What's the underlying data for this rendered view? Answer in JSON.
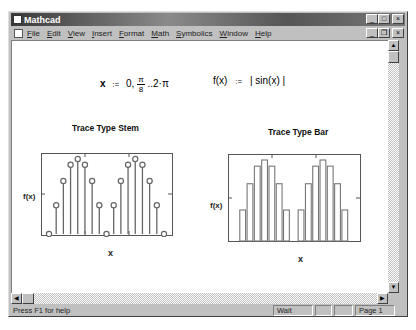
{
  "window": {
    "title": "Mathcad"
  },
  "menubar": {
    "items": [
      "File",
      "Edit",
      "View",
      "Insert",
      "Format",
      "Math",
      "Symbolics",
      "Window",
      "Help"
    ]
  },
  "caption_buttons": {
    "minimize": "_",
    "maximize": "□",
    "close": "×",
    "restore": "❐"
  },
  "worksheet": {
    "range_def": {
      "lhs": "x",
      "assign": ":=",
      "start": "0,",
      "step_num": "π",
      "step_den": "8",
      "end": "..2·π"
    },
    "func_def": {
      "lhs": "f(x)",
      "assign": ":=",
      "rhs": "| sin(x) |"
    },
    "plots": [
      {
        "title": "Trace Type Stem",
        "ylabel": "f(x)",
        "xlabel": "x",
        "trace_type": "stem"
      },
      {
        "title": "Trace Type Bar",
        "ylabel": "f(x)",
        "xlabel": "x",
        "trace_type": "bar"
      }
    ]
  },
  "statusbar": {
    "help": "Press F1 for help",
    "state": "Wait",
    "cell2": "",
    "cell3": "",
    "page": "Page 1"
  },
  "chart_data": [
    {
      "type": "stem",
      "title": "Trace Type Stem",
      "xlabel": "x",
      "ylabel": "f(x)",
      "x": [
        0,
        0.393,
        0.785,
        1.178,
        1.571,
        1.963,
        2.356,
        2.749,
        3.142,
        3.534,
        3.927,
        4.32,
        4.712,
        5.105,
        5.498,
        5.89,
        6.283
      ],
      "values": [
        0,
        0.383,
        0.707,
        0.924,
        1.0,
        0.924,
        0.707,
        0.383,
        0,
        0.383,
        0.707,
        0.924,
        1.0,
        0.924,
        0.707,
        0.383,
        0
      ]
    },
    {
      "type": "bar",
      "title": "Trace Type Bar",
      "xlabel": "x",
      "ylabel": "f(x)",
      "x": [
        0,
        0.393,
        0.785,
        1.178,
        1.571,
        1.963,
        2.356,
        2.749,
        3.142,
        3.534,
        3.927,
        4.32,
        4.712,
        5.105,
        5.498,
        5.89,
        6.283
      ],
      "values": [
        0,
        0.383,
        0.707,
        0.924,
        1.0,
        0.924,
        0.707,
        0.383,
        0,
        0.383,
        0.707,
        0.924,
        1.0,
        0.924,
        0.707,
        0.383,
        0
      ]
    }
  ]
}
